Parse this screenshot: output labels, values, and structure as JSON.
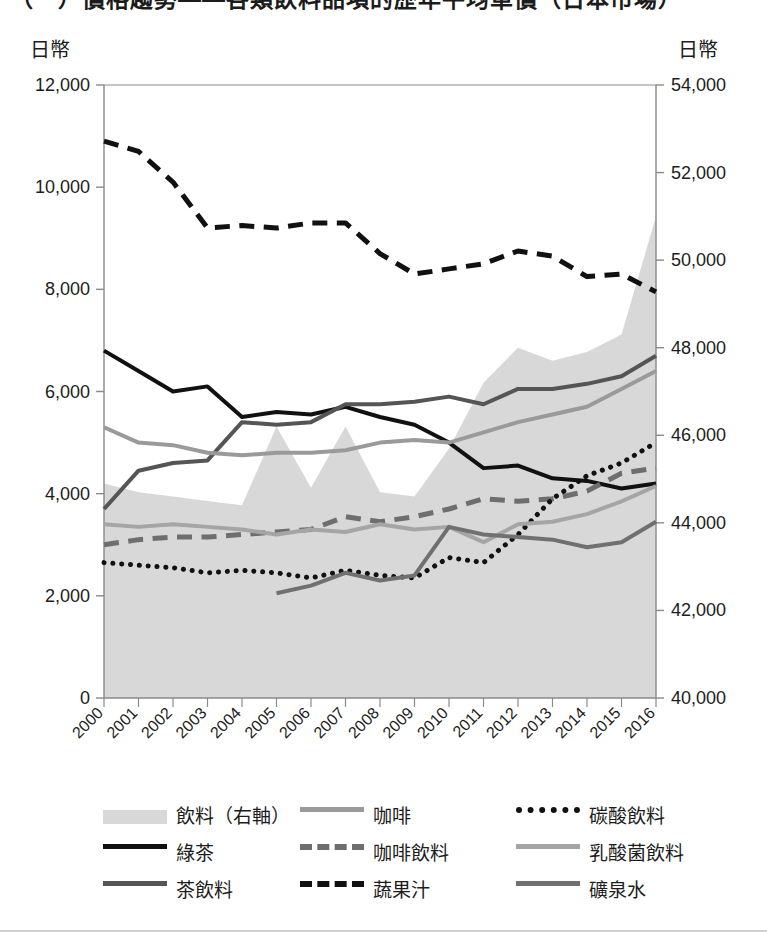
{
  "title": "（一）價格趨勢——各類飲料品項的歷年平均單價（日本市場）",
  "axis": {
    "left_unit": "日幣",
    "right_unit": "日幣",
    "left_ticks": [
      "0",
      "2,000",
      "4,000",
      "6,000",
      "8,000",
      "10,000",
      "12,000"
    ],
    "right_ticks": [
      "40,000",
      "42,000",
      "44,000",
      "46,000",
      "48,000",
      "50,000",
      "52,000",
      "54,000"
    ]
  },
  "legend": {
    "rows": [
      [
        {
          "label": "飲料（右軸）",
          "style": "area",
          "color": "#d8d8d8",
          "name": "beverage-right-axis"
        },
        {
          "label": "咖啡",
          "style": "solid",
          "color": "#9a9a9a",
          "width": 5,
          "name": "coffee"
        },
        {
          "label": "碳酸飲料",
          "style": "dotted",
          "color": "#111111",
          "width": 6,
          "name": "carbonated"
        }
      ],
      [
        {
          "label": "綠茶",
          "style": "solid",
          "color": "#111111",
          "width": 5,
          "name": "green-tea"
        },
        {
          "label": "咖啡飲料",
          "style": "dashed",
          "color": "#6e6e6e",
          "width": 6,
          "name": "coffee-drink"
        },
        {
          "label": "乳酸菌飲料",
          "style": "solid",
          "color": "#a5a5a5",
          "width": 5,
          "name": "lactic-acid"
        }
      ],
      [
        {
          "label": "茶飲料",
          "style": "solid",
          "color": "#555555",
          "width": 5,
          "name": "tea-drink"
        },
        {
          "label": "蔬果汁",
          "style": "dashed",
          "color": "#111111",
          "width": 6,
          "name": "vegetable-fruit-juice"
        },
        {
          "label": "礦泉水",
          "style": "solid",
          "color": "#707070",
          "width": 5,
          "name": "mineral-water"
        }
      ]
    ]
  },
  "chart_data": {
    "type": "line",
    "title": "（一）價格趨勢——各類飲料品項的歷年平均單價（日本市場）",
    "xlabel": "",
    "ylabel": "日幣",
    "y2label": "日幣",
    "grid": false,
    "legend_position": "bottom",
    "categories": [
      2000,
      2001,
      2002,
      2003,
      2004,
      2005,
      2006,
      2007,
      2008,
      2009,
      2010,
      2011,
      2012,
      2013,
      2014,
      2015,
      2016
    ],
    "ylim": [
      0,
      12000
    ],
    "y2lim": [
      40000,
      54000
    ],
    "series": [
      {
        "name": "飲料（右軸）",
        "style": "area",
        "axis": "right",
        "color": "#d8d8d8",
        "values": [
          44900,
          44700,
          44600,
          44500,
          44400,
          46200,
          44800,
          46200,
          44700,
          44600,
          45700,
          47200,
          48000,
          47700,
          47900,
          48300,
          51000
        ]
      },
      {
        "name": "綠茶",
        "style": "solid",
        "axis": "left",
        "color": "#111111",
        "width": 4,
        "values": [
          6800,
          6400,
          6000,
          6100,
          5500,
          5600,
          5550,
          5700,
          5500,
          5350,
          5000,
          4500,
          4550,
          4300,
          4250,
          4100,
          4200
        ]
      },
      {
        "name": "茶飲料",
        "style": "solid",
        "axis": "left",
        "color": "#555555",
        "width": 4,
        "values": [
          3700,
          4450,
          4600,
          4650,
          5400,
          5350,
          5400,
          5750,
          5750,
          5800,
          5900,
          5750,
          6050,
          6050,
          6150,
          6300,
          6700
        ]
      },
      {
        "name": "咖啡",
        "style": "solid",
        "axis": "left",
        "color": "#9a9a9a",
        "width": 4,
        "values": [
          5300,
          5000,
          4950,
          4800,
          4750,
          4800,
          4800,
          4850,
          5000,
          5050,
          5000,
          5200,
          5400,
          5550,
          5700,
          6050,
          6400
        ]
      },
      {
        "name": "咖啡飲料",
        "style": "dashed",
        "axis": "left",
        "color": "#6e6e6e",
        "width": 5,
        "values": [
          3000,
          3100,
          3150,
          3150,
          3200,
          3250,
          3300,
          3550,
          3450,
          3550,
          3700,
          3900,
          3850,
          3900,
          4050,
          4400,
          4500
        ]
      },
      {
        "name": "蔬果汁",
        "style": "dashed",
        "axis": "left",
        "color": "#111111",
        "width": 5,
        "values": [
          10900,
          10700,
          10100,
          9200,
          9250,
          9200,
          9300,
          9300,
          8700,
          8300,
          8400,
          8500,
          8750,
          8650,
          8250,
          8300,
          7950
        ]
      },
      {
        "name": "碳酸飲料",
        "style": "dotted",
        "axis": "left",
        "color": "#111111",
        "width": 5,
        "values": [
          2650,
          2600,
          2550,
          2450,
          2500,
          2450,
          2350,
          2500,
          2400,
          2350,
          2750,
          2650,
          3200,
          3900,
          4350,
          4600,
          5000
        ]
      },
      {
        "name": "乳酸菌飲料",
        "style": "solid",
        "axis": "left",
        "color": "#a5a5a5",
        "width": 4,
        "values": [
          3400,
          3350,
          3400,
          3350,
          3300,
          3200,
          3300,
          3250,
          3400,
          3300,
          3350,
          3050,
          3400,
          3450,
          3600,
          3850,
          4150
        ]
      },
      {
        "name": "礦泉水",
        "style": "solid",
        "axis": "left",
        "color": "#707070",
        "width": 4,
        "start_index": 5,
        "values": [
          null,
          null,
          null,
          null,
          null,
          2050,
          2200,
          2450,
          2300,
          2400,
          3350,
          3200,
          3150,
          3100,
          2950,
          3050,
          3450
        ]
      }
    ]
  }
}
